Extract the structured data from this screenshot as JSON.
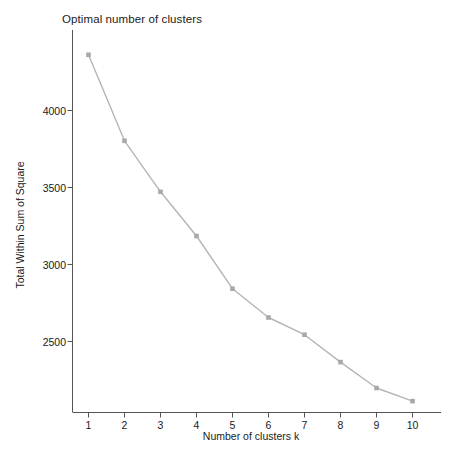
{
  "chart_data": {
    "type": "line",
    "title": "Optimal number of clusters",
    "xlabel": "Number of clusters k",
    "ylabel": "Total Within Sum of Square",
    "x": [
      1,
      2,
      3,
      4,
      5,
      6,
      7,
      8,
      9,
      10
    ],
    "values": [
      4362,
      3803,
      3472,
      3185,
      2843,
      2656,
      2544,
      2366,
      2198,
      2113
    ],
    "series": [
      {
        "name": "Total Within Sum of Square",
        "values": [
          4362,
          3803,
          3472,
          3185,
          2843,
          2656,
          2544,
          2366,
          2198,
          2113
        ]
      }
    ],
    "xtick_labels": [
      "1",
      "2",
      "3",
      "4",
      "5",
      "6",
      "7",
      "8",
      "9",
      "10"
    ],
    "ytick_labels": [
      "2500",
      "3000",
      "3500",
      "4000"
    ],
    "ytick_values": [
      2500,
      3000,
      3500,
      4000
    ],
    "xlim": [
      0.5,
      10.5
    ],
    "ylim": [
      2050,
      4420
    ],
    "grid": false,
    "legend": "none",
    "marker": "square",
    "line_color": "#b5b5b5",
    "marker_color": "#a8a8a8",
    "axis_color": "#555555",
    "background_color": "#ffffff"
  }
}
